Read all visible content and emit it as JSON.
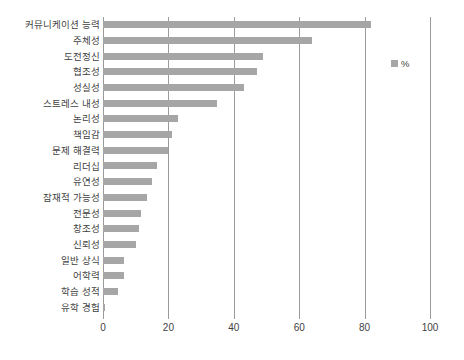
{
  "chart_data": {
    "type": "bar",
    "orientation": "horizontal",
    "title": "",
    "subtitle": "",
    "xlabel": "",
    "ylabel": "",
    "xlim": [
      0,
      100
    ],
    "xticks": [
      "0",
      "20",
      "40",
      "60",
      "80",
      "100"
    ],
    "xtick_values": [
      0,
      20,
      40,
      60,
      80,
      100
    ],
    "grid": "vertical",
    "legend": {
      "position": "top-right",
      "entries": [
        {
          "label": "%",
          "color": "#a6a6a6",
          "marker": "square"
        }
      ]
    },
    "series": [
      {
        "name": "%",
        "color": "#a6a6a6",
        "values": [
          82,
          64,
          49,
          47,
          43,
          35,
          23,
          21,
          20,
          16.5,
          15,
          13.5,
          11.5,
          11,
          10,
          6.5,
          6.5,
          4.5,
          0.5
        ]
      }
    ],
    "categories": [
      "커뮤니케이션 능력",
      "주체성",
      "도전정신",
      "협조성",
      "성실성",
      "스트레스 내성",
      "논리성",
      "책임감",
      "문제 해결력",
      "리더십",
      "유연성",
      "잠재적 가능성",
      "전문성",
      "창조성",
      "신뢰성",
      "일반 상식",
      "어학력",
      "학습 성적",
      "유학 경험"
    ],
    "points": [
      {
        "category": "커뮤니케이션 능력",
        "value": 82
      },
      {
        "category": "주체성",
        "value": 64
      },
      {
        "category": "도전정신",
        "value": 49
      },
      {
        "category": "협조성",
        "value": 47
      },
      {
        "category": "성실성",
        "value": 43
      },
      {
        "category": "스트레스 내성",
        "value": 35
      },
      {
        "category": "논리성",
        "value": 23
      },
      {
        "category": "책임감",
        "value": 21
      },
      {
        "category": "문제 해결력",
        "value": 20
      },
      {
        "category": "리더십",
        "value": 16.5
      },
      {
        "category": "유연성",
        "value": 15
      },
      {
        "category": "잠재적 가능성",
        "value": 13.5
      },
      {
        "category": "전문성",
        "value": 11.5
      },
      {
        "category": "창조성",
        "value": 11
      },
      {
        "category": "신뢰성",
        "value": 10
      },
      {
        "category": "일반 상식",
        "value": 6.5
      },
      {
        "category": "어학력",
        "value": 6.5
      },
      {
        "category": "학습 성적",
        "value": 4.5
      },
      {
        "category": "유학 경험",
        "value": 0.5
      }
    ]
  },
  "colors": {
    "bar": "#a6a6a6",
    "grid": "#9b9b9b",
    "text": "#3f3f3f",
    "background": "#ffffff"
  }
}
